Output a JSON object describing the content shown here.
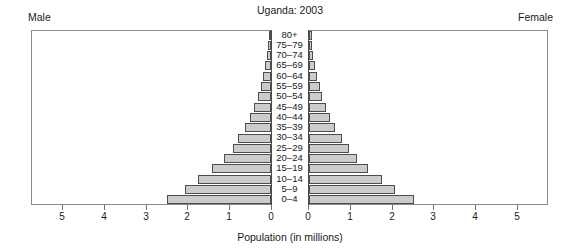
{
  "header": {
    "title": "Uganda: 2003",
    "male_label": "Male",
    "female_label": "Female"
  },
  "axis": {
    "x_title": "Population (in millions)",
    "tick_labels": [
      "5",
      "4",
      "3",
      "2",
      "1",
      "0",
      "0",
      "1",
      "2",
      "3",
      "4",
      "5"
    ]
  },
  "colors": {
    "bar_fill": "#cccccc",
    "bar_border": "#4d4d4d",
    "frame": "#8a8a8a",
    "text": "#1a1a1a",
    "background": "#ffffff"
  },
  "chart_data": {
    "type": "bar",
    "title": "Uganda: 2003",
    "subtitle": "",
    "xlabel": "Population (in millions)",
    "ylabel": "",
    "orientation": "horizontal",
    "layout": "population-pyramid",
    "grid": false,
    "legend_position": "none",
    "xlim": [
      -5,
      5
    ],
    "xtick_values": [
      5,
      4,
      3,
      2,
      1,
      0,
      0,
      1,
      2,
      3,
      4,
      5
    ],
    "categories": [
      "0-4",
      "5-9",
      "10-14",
      "15-19",
      "20-24",
      "25-29",
      "30-34",
      "35-39",
      "40-44",
      "45-49",
      "50-54",
      "55-59",
      "60-64",
      "65-69",
      "70-74",
      "75-79",
      "80+"
    ],
    "series": [
      {
        "name": "Male",
        "side": "left",
        "values": [
          2.5,
          2.05,
          1.75,
          1.42,
          1.12,
          0.92,
          0.78,
          0.62,
          0.5,
          0.4,
          0.32,
          0.25,
          0.2,
          0.15,
          0.1,
          0.06,
          0.04
        ]
      },
      {
        "name": "Female",
        "side": "right",
        "values": [
          2.5,
          2.05,
          1.75,
          1.42,
          1.15,
          0.95,
          0.8,
          0.62,
          0.5,
          0.4,
          0.32,
          0.26,
          0.2,
          0.15,
          0.1,
          0.07,
          0.05
        ]
      }
    ]
  }
}
